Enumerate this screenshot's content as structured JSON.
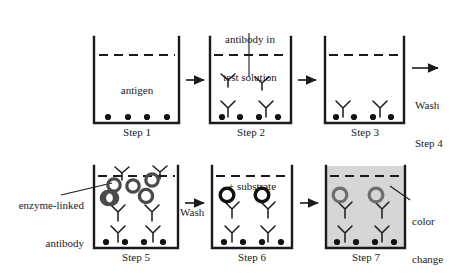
{
  "figure": {
    "colors": {
      "ink": "#1a1a1a",
      "well_stroke": "#1a1a1a",
      "enzyme_ring_dark": "#4a4a4a",
      "enzyme_ring_black": "#111111",
      "enzyme_ring_gray": "#6e6e6e",
      "color_change_fill": "#d6d6d6",
      "background": "#ffffff"
    }
  },
  "steps": [
    {
      "id": "step-1",
      "label": "Step 1",
      "inside_label": "antigen",
      "antigen_dots": 4,
      "free_antibodies": 0,
      "bound_antibodies": 0,
      "enzyme_antibodies": 0,
      "filled": false
    },
    {
      "id": "step-2",
      "label": "Step 2",
      "callout": "antibody in\ntest solution",
      "callout_line1": "antibody in",
      "callout_line2": "test solution",
      "antigen_dots": 4,
      "free_antibodies": 2,
      "bound_antibodies": 2,
      "enzyme_antibodies": 0,
      "filled": false
    },
    {
      "id": "step-3",
      "label": "Step 3",
      "antigen_dots": 4,
      "free_antibodies": 0,
      "bound_antibodies": 2,
      "enzyme_antibodies": 0,
      "filled": false
    },
    {
      "id": "step-5",
      "label": "Step 5",
      "callout_line1": "enzyme-linked",
      "callout_line2": "antibody",
      "antigen_dots": 4,
      "free_antibodies": 0,
      "bound_antibodies": 2,
      "enzyme_antibodies": 6,
      "filled": false
    },
    {
      "id": "step-6",
      "label": "Step 6",
      "inside_label": "+ substrate",
      "antigen_dots": 4,
      "free_antibodies": 0,
      "bound_antibodies": 2,
      "enzyme_antibodies": 2,
      "filled": false
    },
    {
      "id": "step-7",
      "label": "Step 7",
      "callout_line1": "color",
      "callout_line2": "change",
      "antigen_dots": 4,
      "free_antibodies": 0,
      "bound_antibodies": 2,
      "enzyme_antibodies": 2,
      "filled": true
    }
  ],
  "arrows": [
    {
      "id": "arrow-1-2",
      "caption": ""
    },
    {
      "id": "arrow-2-3",
      "caption": ""
    },
    {
      "id": "arrow-3-wash",
      "caption_line1": "Wash",
      "caption_line2": "Step 4"
    },
    {
      "id": "arrow-5-6",
      "caption_line1": "Wash",
      "caption_line2": ""
    },
    {
      "id": "arrow-6-7",
      "caption": ""
    }
  ],
  "labels": {
    "antigen": "antigen",
    "antibody_in": "antibody in",
    "test_solution": "test solution",
    "wash": "Wash",
    "step4": "Step 4",
    "wash2": "Wash",
    "enzyme_linked": "enzyme-linked",
    "antibody": "antibody",
    "plus_substrate": "+ substrate",
    "color": "color",
    "change": "change",
    "step1": "Step 1",
    "step2": "Step 2",
    "step3": "Step 3",
    "step5": "Step 5",
    "step6": "Step 6",
    "step7": "Step 7"
  }
}
